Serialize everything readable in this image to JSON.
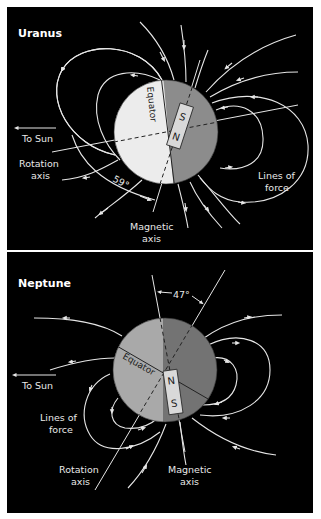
{
  "figure": {
    "colors": {
      "background": "#000000",
      "border": "#ffffff",
      "field_lines": "#e6e6e6",
      "uranus_light": "#ececec",
      "uranus_dark": "#8c8c8c",
      "neptune_light": "#a9a9a9",
      "neptune_dark": "#737373",
      "magnet_fill": "#d9d9d9"
    },
    "uranus": {
      "title": "Uranus",
      "equator_label": "Equator",
      "magnet_top": "S",
      "magnet_bottom": "N",
      "to_sun": "To Sun",
      "rotation_axis_line1": "Rotation",
      "rotation_axis_line2": "axis",
      "angle": "59°",
      "magnetic_axis_line1": "Magnetic",
      "magnetic_axis_line2": "axis",
      "lines_of_force_line1": "Lines of",
      "lines_of_force_line2": "force"
    },
    "neptune": {
      "title": "Neptune",
      "equator_label": "Equator",
      "magnet_top": "N",
      "magnet_bottom": "S",
      "to_sun": "To Sun",
      "angle": "47°",
      "lines_of_force_line1": "Lines of",
      "lines_of_force_line2": "force",
      "rotation_axis_line1": "Rotation",
      "rotation_axis_line2": "axis",
      "magnetic_axis_line1": "Magnetic",
      "magnetic_axis_line2": "axis"
    }
  }
}
